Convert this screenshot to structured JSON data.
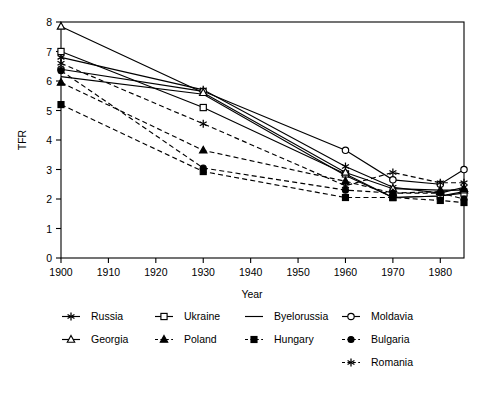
{
  "chart_data": {
    "type": "line",
    "title": "",
    "xlabel": "Year",
    "ylabel": "TFR",
    "xlim": [
      1900,
      1985
    ],
    "ylim": [
      0,
      8
    ],
    "xticks": [
      1900,
      1910,
      1920,
      1930,
      1940,
      1950,
      1960,
      1970,
      1980
    ],
    "xticklabels": [
      "1900",
      "1910",
      "1920",
      "1930",
      "1940",
      "1950",
      "1960",
      "1970",
      "1980"
    ],
    "yticks": [
      0,
      1,
      2,
      3,
      4,
      5,
      6,
      7,
      8
    ],
    "yticklabels": [
      "0",
      "1",
      "2",
      "3",
      "4",
      "5",
      "6",
      "7",
      "8"
    ],
    "grid": false,
    "legend_position": "below",
    "x": [
      1900,
      1930,
      1960,
      1970,
      1980,
      1985
    ],
    "series": [
      {
        "name": "Russia",
        "marker": "asterisk",
        "linestyle": "solid",
        "values": [
          6.8,
          5.7,
          3.1,
          2.4,
          2.2,
          2.4
        ]
      },
      {
        "name": "Ukraine",
        "marker": "open-square",
        "linestyle": "solid",
        "values": [
          7.0,
          5.1,
          2.85,
          2.05,
          2.1,
          2.2
        ]
      },
      {
        "name": "Byelorussia",
        "marker": "none",
        "linestyle": "solid",
        "values": [
          6.15,
          5.55,
          2.8,
          2.05,
          2.1,
          2.25
        ]
      },
      {
        "name": "Moldavia",
        "marker": "open-circle",
        "linestyle": "solid",
        "values": [
          6.4,
          5.65,
          3.65,
          2.65,
          2.5,
          3.0
        ]
      },
      {
        "name": "Georgia",
        "marker": "open-triangle",
        "linestyle": "solid",
        "values": [
          7.85,
          5.6,
          2.9,
          2.35,
          2.3,
          2.3
        ]
      },
      {
        "name": "Poland",
        "marker": "solid-triangle",
        "linestyle": "dashed",
        "values": [
          5.95,
          3.65,
          2.6,
          2.2,
          2.25,
          2.35
        ]
      },
      {
        "name": "Hungary",
        "marker": "solid-square",
        "linestyle": "dashed",
        "values": [
          5.2,
          2.93,
          2.05,
          2.05,
          1.95,
          1.88
        ]
      },
      {
        "name": "Bulgaria",
        "marker": "solid-circle",
        "linestyle": "dashed",
        "values": [
          6.35,
          3.05,
          2.3,
          2.2,
          2.2,
          2.0
        ]
      },
      {
        "name": "Romania",
        "marker": "asterisk",
        "linestyle": "dashed",
        "values": [
          6.6,
          4.55,
          2.45,
          2.9,
          2.55,
          2.55
        ]
      }
    ]
  },
  "axes": {
    "ylabel": "TFR",
    "xlabel": "Year"
  },
  "legend": {
    "row1": [
      {
        "label": "Russia",
        "marker": "asterisk",
        "linestyle": "solid"
      },
      {
        "label": "Ukraine",
        "marker": "open-square",
        "linestyle": "solid"
      },
      {
        "label": "Byelorussia",
        "marker": "none",
        "linestyle": "solid"
      },
      {
        "label": "Moldavia",
        "marker": "open-circle",
        "linestyle": "solid"
      }
    ],
    "row2": [
      {
        "label": "Georgia",
        "marker": "open-triangle",
        "linestyle": "solid"
      },
      {
        "label": "Poland",
        "marker": "solid-triangle",
        "linestyle": "dashed"
      },
      {
        "label": "Hungary",
        "marker": "solid-square",
        "linestyle": "dashed"
      },
      {
        "label": "Bulgaria",
        "marker": "solid-circle",
        "linestyle": "dashed"
      }
    ],
    "row3": [
      {
        "label": "Romania",
        "marker": "asterisk",
        "linestyle": "dashed"
      }
    ]
  },
  "colors": {
    "foreground": "#000000",
    "background": "#ffffff"
  }
}
